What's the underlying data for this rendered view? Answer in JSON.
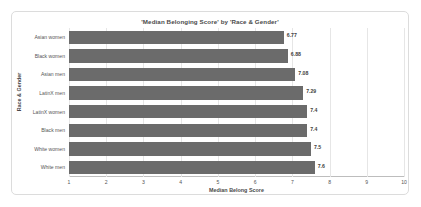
{
  "chart_data": {
    "type": "bar",
    "orientation": "horizontal",
    "title": "'Median Belonging Score' by 'Race & Gender'",
    "xlabel": "Median Belong Score",
    "ylabel": "Race & Gender",
    "xlim": [
      1,
      10
    ],
    "xticks": [
      "1",
      "2",
      "3",
      "4",
      "5",
      "6",
      "7",
      "8",
      "9",
      "10"
    ],
    "grid": true,
    "legend": null,
    "bar_color": "#6b6b6b",
    "categories": [
      "Asian women",
      "Black women",
      "Asian men",
      "LatinX men",
      "LatinX women",
      "Black men",
      "White women",
      "White men"
    ],
    "values": [
      6.77,
      6.88,
      7.08,
      7.29,
      7.4,
      7.4,
      7.5,
      7.6
    ],
    "value_labels": [
      "6.77",
      "6.88",
      "7.08",
      "7.29",
      "7.4",
      "7.4",
      "7.5",
      "7.6"
    ]
  }
}
